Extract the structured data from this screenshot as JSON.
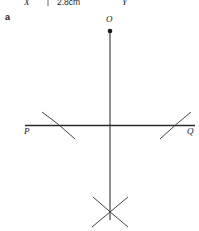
{
  "figure": {
    "part_label": "a",
    "measurement_label": "2.8cm",
    "points": {
      "x": "X",
      "y": "Y",
      "o": "O",
      "p": "P",
      "q": "Q"
    },
    "colors": {
      "ink": "#1a1a1a",
      "line": "#2b2b2b",
      "arc": "#3a3a3a",
      "background": "#ffffff"
    },
    "geometry": {
      "vertex_o": [
        110,
        31
      ],
      "vertical_line": [
        [
          110,
          31
        ],
        [
          110,
          220
        ]
      ],
      "horizontal_line_pq": [
        [
          25,
          125
        ],
        [
          195,
          125
        ]
      ],
      "arc_left": [
        [
          42,
          112
        ],
        [
          74,
          139
        ]
      ],
      "arc_right": [
        [
          160,
          139
        ],
        [
          191,
          112
        ]
      ],
      "cross_center": [
        110,
        212
      ],
      "tick_top": [
        48,
        2
      ]
    }
  }
}
